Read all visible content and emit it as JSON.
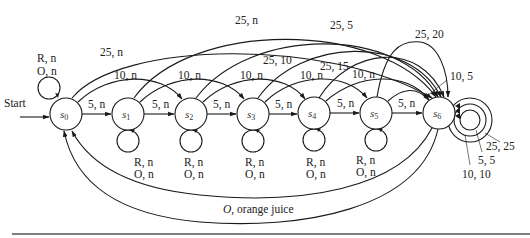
{
  "diagram": {
    "start_label": "Start",
    "states": [
      {
        "id": "s0",
        "name": "s",
        "sub": "0",
        "x": 66,
        "y": 114
      },
      {
        "id": "s1",
        "name": "s",
        "sub": "1",
        "x": 128,
        "y": 114
      },
      {
        "id": "s2",
        "name": "s",
        "sub": "2",
        "x": 191,
        "y": 114
      },
      {
        "id": "s3",
        "name": "s",
        "sub": "3",
        "x": 253,
        "y": 114
      },
      {
        "id": "s4",
        "name": "s",
        "sub": "4",
        "x": 314,
        "y": 113
      },
      {
        "id": "s5",
        "name": "s",
        "sub": "5",
        "x": 376,
        "y": 113
      },
      {
        "id": "s6",
        "name": "s",
        "sub": "6",
        "x": 439,
        "y": 113
      }
    ],
    "labels": {
      "five_n": "5, n",
      "ten_n": "10, n",
      "twentyfive_n": "25, n",
      "r_n": "R, n",
      "o_n": "O, n",
      "t25_5": "25, 5",
      "t25_10": "25, 10",
      "t25_15": "25, 15",
      "t25_20": "25, 20",
      "t10_5": "10, 5",
      "t25_25": "25, 25",
      "t5_5": "5, 5",
      "t10_10": "10, 10",
      "o_prefix": "O",
      "orange_juice": ", orange juice"
    },
    "transitions": [
      {
        "from": "s0",
        "to": "s0",
        "label": "R, n / O, n"
      },
      {
        "from": "s0",
        "to": "s1",
        "label": "5, n"
      },
      {
        "from": "s1",
        "to": "s2",
        "label": "5, n"
      },
      {
        "from": "s2",
        "to": "s3",
        "label": "5, n"
      },
      {
        "from": "s3",
        "to": "s4",
        "label": "5, n"
      },
      {
        "from": "s4",
        "to": "s5",
        "label": "5, n"
      },
      {
        "from": "s5",
        "to": "s6",
        "label": "5, n"
      },
      {
        "from": "s0",
        "to": "s2",
        "label": "10, n"
      },
      {
        "from": "s1",
        "to": "s3",
        "label": "10, n"
      },
      {
        "from": "s2",
        "to": "s4",
        "label": "10, n"
      },
      {
        "from": "s3",
        "to": "s5",
        "label": "10, n"
      },
      {
        "from": "s4",
        "to": "s6",
        "label": "10, n"
      },
      {
        "from": "s5",
        "to": "s6",
        "label": "10, 5"
      },
      {
        "from": "s0",
        "to": "s5",
        "label": "25, n"
      },
      {
        "from": "s1",
        "to": "s6",
        "label": "25, n"
      },
      {
        "from": "s2",
        "to": "s6",
        "label": "25, 5"
      },
      {
        "from": "s3",
        "to": "s6",
        "label": "25, 10"
      },
      {
        "from": "s4",
        "to": "s6",
        "label": "25, 15"
      },
      {
        "from": "s5",
        "to": "s6",
        "label": "25, 20"
      },
      {
        "from": "s1",
        "to": "s1",
        "label": "R, n / O, n"
      },
      {
        "from": "s2",
        "to": "s2",
        "label": "R, n / O, n"
      },
      {
        "from": "s3",
        "to": "s3",
        "label": "R, n / O, n"
      },
      {
        "from": "s4",
        "to": "s4",
        "label": "R, n / O, n"
      },
      {
        "from": "s5",
        "to": "s5",
        "label": "R, n / O, n"
      },
      {
        "from": "s6",
        "to": "s6",
        "label": "5, 5"
      },
      {
        "from": "s6",
        "to": "s6",
        "label": "10, 10"
      },
      {
        "from": "s6",
        "to": "s6",
        "label": "25, 25"
      },
      {
        "from": "s6",
        "to": "s0",
        "label": "O, orange juice"
      },
      {
        "from": "s6",
        "to": "s0",
        "label": ""
      }
    ]
  }
}
